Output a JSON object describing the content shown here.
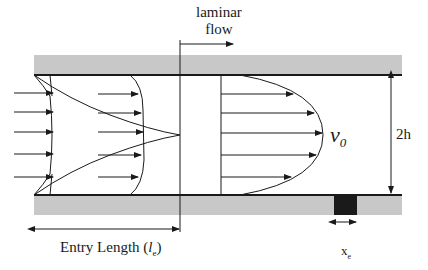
{
  "diagram": {
    "title_label": {
      "line1": "laminar",
      "line2": "flow"
    },
    "velocity_label": "v",
    "velocity_sub": "0",
    "height_label": "2h",
    "entry_length_label": "Entry Length (",
    "entry_length_symbol": "l",
    "entry_length_sub": "e",
    "entry_length_close": ")",
    "sensor_label": "x",
    "sensor_sub": "e",
    "colors": {
      "wall_fill": "#c8c8c8",
      "line": "#1a1a1a",
      "sensor": "#1a1a1a"
    }
  }
}
